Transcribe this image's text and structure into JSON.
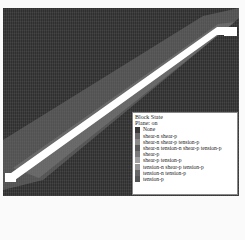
{
  "legend": {
    "title": "Block State",
    "subtitle": "Plane: on",
    "items": [
      {
        "label": "None",
        "color": "#3a3a3a"
      },
      {
        "label": "shear-n shear-p",
        "color": "#6a6a6a"
      },
      {
        "label": "shear-n shear-p tension-p",
        "color": "#8a8a8a"
      },
      {
        "label": "shear-n tension-n shear-p tension-p",
        "color": "#5a5a5a"
      },
      {
        "label": "shear-p",
        "color": "#7a7a7a"
      },
      {
        "label": "shear-p tension-p",
        "color": "#a0a0a0"
      },
      {
        "label": "tension-n shear-p tension-p",
        "color": "#959595"
      },
      {
        "label": "tension-n tension-p",
        "color": "#666666"
      },
      {
        "label": "tension-p",
        "color": "#555555"
      }
    ]
  },
  "plot": {
    "background_color": "#3c3c3c",
    "shear_band_color": "#6e6e6e",
    "fault_band_color": "#ffffff"
  }
}
